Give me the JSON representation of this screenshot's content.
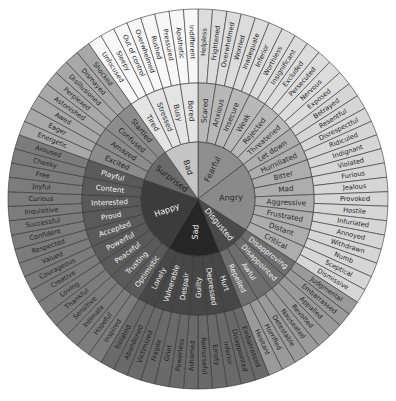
{
  "caption": "",
  "geometry": {
    "cx": 198,
    "cy": 199,
    "r_core": 57,
    "r_mid": 116,
    "r_outer": 190,
    "start_deg": -90
  },
  "cores": [
    {
      "name": "Fearful",
      "color": "#8e8e8e",
      "text": "#2a2a2a",
      "mid_color": "#b8b8b8",
      "outer_color": "#dcdcdc",
      "children": [
        {
          "name": "Scared",
          "outer": [
            "Helpless",
            "Frightened"
          ]
        },
        {
          "name": "Anxious",
          "outer": [
            "Overwhelmed",
            "Worried"
          ]
        },
        {
          "name": "Insecure",
          "outer": [
            "Inadequate",
            "Inferior"
          ]
        },
        {
          "name": "Weak",
          "outer": [
            "Worthless",
            "Insignificant"
          ]
        },
        {
          "name": "Rejected",
          "outer": [
            "Excluded",
            "Persecuted"
          ]
        },
        {
          "name": "Threatened",
          "outer": [
            "Nervous",
            "Exposed"
          ]
        }
      ]
    },
    {
      "name": "Angry",
      "color": "#8a8a8a",
      "text": "#2a2a2a",
      "mid_color": "#adadad",
      "outer_color": "#d6d6d6",
      "children": [
        {
          "name": "Let down",
          "outer": [
            "Betrayed",
            "Resentful"
          ]
        },
        {
          "name": "Humiliated",
          "outer": [
            "Disrespectful",
            "Ridiculed"
          ]
        },
        {
          "name": "Bitter",
          "outer": [
            "Indignant",
            "Violated"
          ]
        },
        {
          "name": "Mad",
          "outer": [
            "Furious",
            "Jealous"
          ]
        },
        {
          "name": "Aggressive",
          "outer": [
            "Provoked",
            "Hostile"
          ]
        },
        {
          "name": "Frustrated",
          "outer": [
            "Infuriated",
            "Annoyed"
          ]
        },
        {
          "name": "Distant",
          "outer": [
            "Withdrawn",
            "Numb"
          ]
        },
        {
          "name": "Critical",
          "outer": [
            "Sceptical",
            "Dismissive"
          ]
        }
      ]
    },
    {
      "name": "Disgusted",
      "color": "#4a4a4a",
      "text": "#f2f2f2",
      "mid_color": "#6e6e6e",
      "outer_color": "#9a9a9a",
      "children": [
        {
          "name": "Disapproving",
          "outer": [
            "Judgmental",
            "Embarrassed"
          ]
        },
        {
          "name": "Disappointed",
          "outer": [
            "Appalled",
            "Revolted"
          ]
        },
        {
          "name": "Awful",
          "outer": [
            "Nauseated",
            "Detestable"
          ]
        },
        {
          "name": "Repelled",
          "outer": [
            "Horrified",
            "Hesitant"
          ]
        }
      ]
    },
    {
      "name": "Sad",
      "color": "#262626",
      "text": "#f2f2f2",
      "mid_color": "#474747",
      "outer_color": "#6a6a6a",
      "children": [
        {
          "name": "Hurt",
          "outer": [
            "Embarrassed",
            "Disappointed"
          ]
        },
        {
          "name": "Depressed",
          "outer": [
            "Inferior",
            "Empty"
          ]
        },
        {
          "name": "Guilty",
          "outer": [
            "Remorseful",
            "Ashamed"
          ]
        },
        {
          "name": "Despair",
          "outer": [
            "Powerless",
            "Grief"
          ]
        },
        {
          "name": "Vulnerable",
          "outer": [
            "Fragile",
            "Victimized"
          ]
        },
        {
          "name": "Lonely",
          "outer": [
            "Abandoned",
            "Isolated"
          ]
        }
      ]
    },
    {
      "name": "Happy",
      "color": "#3c3c3c",
      "text": "#f2f2f2",
      "mid_color": "#5a5a5a",
      "outer_color": "#7c7c7c",
      "children": [
        {
          "name": "Optimistic",
          "outer": [
            "Inspired",
            "Hopeful"
          ]
        },
        {
          "name": "Trusting",
          "outer": [
            "Intimate",
            "Sensitive"
          ]
        },
        {
          "name": "Peaceful",
          "outer": [
            "Thankful",
            "Loving"
          ]
        },
        {
          "name": "Powerful",
          "outer": [
            "Creative",
            "Courageous"
          ]
        },
        {
          "name": "Accepted",
          "outer": [
            "Valued",
            "Respected"
          ]
        },
        {
          "name": "Proud",
          "outer": [
            "Confident",
            "Successful"
          ]
        },
        {
          "name": "Interested",
          "outer": [
            "Inquisitive",
            "Curious"
          ]
        },
        {
          "name": "Content",
          "outer": [
            "Joyful",
            "Free"
          ]
        },
        {
          "name": "Playful",
          "outer": [
            "Cheeky",
            "Aroused"
          ]
        }
      ]
    },
    {
      "name": "Surprised",
      "color": "#6a6a6a",
      "text": "#1e1e1e",
      "mid_color": "#8c8c8c",
      "outer_color": "#a8a8a8",
      "children": [
        {
          "name": "Excited",
          "outer": [
            "Energetic",
            "Eager"
          ]
        },
        {
          "name": "Amazed",
          "outer": [
            "Awed",
            "Astonished"
          ]
        },
        {
          "name": "Confused",
          "outer": [
            "Perplexed",
            "Disillusioned"
          ]
        },
        {
          "name": "Startled",
          "outer": [
            "Dismayed",
            "Shocked"
          ]
        }
      ]
    },
    {
      "name": "Bad",
      "color": "#c4c4c4",
      "text": "#2a2a2a",
      "mid_color": "#e4e4e4",
      "outer_color": "#f7f7f7",
      "children": [
        {
          "name": "Tired",
          "outer": [
            "Unfocused",
            "Sleepy"
          ]
        },
        {
          "name": "Stressed",
          "outer": [
            "Out of control",
            "Overwhelmed"
          ]
        },
        {
          "name": "Busy",
          "outer": [
            "Rushed",
            "Pressured"
          ]
        },
        {
          "name": "Bored",
          "outer": [
            "Apathetic",
            "Indifferent"
          ]
        }
      ]
    }
  ]
}
